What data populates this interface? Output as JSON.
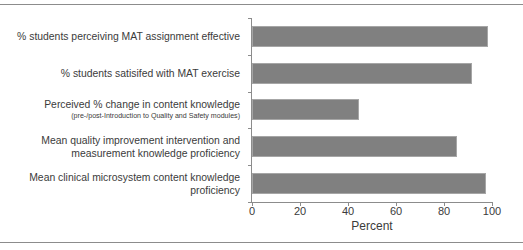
{
  "chart_data": {
    "type": "bar",
    "orientation": "horizontal",
    "title": "",
    "subtitle": "",
    "xlabel": "Percent",
    "ylabel": "",
    "xlim": [
      0,
      100
    ],
    "xticks": [
      0,
      20,
      40,
      60,
      80,
      100
    ],
    "xtick_labels": [
      "0",
      "20",
      "40",
      "60",
      "80",
      "100"
    ],
    "grid": false,
    "legend": false,
    "bar_color": "#808080",
    "bar_edge_color": "#a6a6a6",
    "axis_color": "#8c8c8c",
    "text_color": "#3b3b3b",
    "categories": [
      "% students perceiving MAT assignment effective",
      "% students satisifed with MAT exercise",
      "Perceived % change in content knowledge",
      "Mean quality improvement intervention and\nmeasurement knowledge proficiency",
      "Mean clinical microsystem content knowledge\nproficiency"
    ],
    "category_sublabels": [
      "",
      "",
      "(pre-/post-Introduction to Quality and Safety modules)",
      "",
      ""
    ],
    "values": [
      98.5,
      91.5,
      44.5,
      85.5,
      97.5
    ]
  }
}
